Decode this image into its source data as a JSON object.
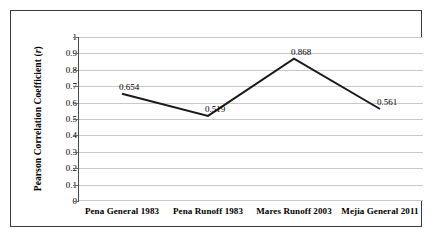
{
  "chart_data": {
    "type": "line",
    "title": "",
    "xlabel": "",
    "ylabel": "Pearson Correlation Coefficient (r)",
    "ylabel_plain": "Pearson Correlation Coefficient",
    "ylabel_symbol": "r",
    "categories": [
      "Pena General 1983",
      "Pena Runoff 1983",
      "Mares Runoff 2003",
      "Mejia General 2011"
    ],
    "values": [
      0.654,
      0.519,
      0.868,
      0.561
    ],
    "point_labels": [
      "0.654",
      "0.519",
      "0.868",
      "0.561"
    ],
    "ylim": [
      0,
      1
    ],
    "ytick_values": [
      0,
      0.1,
      0.2,
      0.3,
      0.4,
      0.5,
      0.6,
      0.7,
      0.8,
      0.9,
      1
    ],
    "ytick_labels": [
      "0",
      "0.1",
      "0.2",
      "0.3",
      "0.4",
      "0.5",
      "0.6",
      "0.7",
      "0.8",
      "0.9",
      "1"
    ],
    "grid": true,
    "grid_axis": "y",
    "legend": false,
    "legend_position": "none",
    "markers": false,
    "series": [
      {
        "name": "Pearson Correlation Coefficient",
        "values": [
          0.654,
          0.519,
          0.868,
          0.561
        ],
        "color": "#1a1a1a",
        "line_width": 2
      }
    ],
    "colors": {
      "line": "#1a1a1a",
      "gridline": "#c8c8c8",
      "axis": "#4a4a4a",
      "text": "#000000",
      "frame": "#3a3a3a",
      "background": "#ffffff"
    }
  }
}
